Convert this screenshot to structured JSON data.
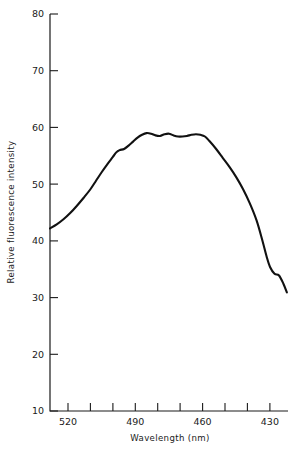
{
  "chart_data": {
    "type": "line",
    "title": "",
    "xlabel": "Wavelength (nm)",
    "ylabel": "Relative fluorescence intensity",
    "xlim": [
      528,
      422
    ],
    "ylim": [
      10,
      80
    ],
    "x_axis_reversed": true,
    "grid": false,
    "legend": null,
    "xticks_major": [
      520,
      490,
      460,
      430
    ],
    "xticklabels": [
      "520",
      "490",
      "460",
      "430"
    ],
    "xticks_minor": [
      520,
      510,
      500,
      490,
      480,
      470,
      460,
      450,
      440,
      430
    ],
    "yticks": [
      10,
      20,
      30,
      40,
      50,
      60,
      70,
      80
    ],
    "yticklabels": [
      "10",
      "20",
      "30",
      "40",
      "50",
      "60",
      "70",
      "80"
    ],
    "tick_direction": "in",
    "series": [
      {
        "name": "fluorescence emission",
        "color": "#111111",
        "x": [
          528.0,
          525.0,
          522.0,
          519.0,
          516.0,
          513.0,
          510.0,
          507.5,
          505.0,
          502.5,
          500.0,
          498.5,
          497.0,
          495.0,
          493.0,
          491.0,
          489.0,
          487.0,
          485.0,
          483.0,
          481.0,
          479.0,
          477.0,
          475.0,
          473.0,
          471.0,
          469.0,
          467.0,
          465.0,
          463.0,
          461.0,
          459.0,
          457.0,
          454.0,
          451.0,
          448.0,
          445.0,
          442.0,
          439.0,
          436.0,
          433.5,
          431.5,
          430.0,
          428.0,
          426.0,
          424.0,
          422.5
        ],
        "y": [
          42.2,
          42.9,
          43.8,
          44.9,
          46.2,
          47.6,
          49.1,
          50.6,
          52.1,
          53.5,
          54.8,
          55.6,
          56.0,
          56.2,
          56.8,
          57.5,
          58.2,
          58.7,
          59.0,
          58.9,
          58.6,
          58.5,
          58.8,
          58.9,
          58.6,
          58.4,
          58.4,
          58.5,
          58.7,
          58.8,
          58.7,
          58.4,
          57.6,
          56.2,
          54.6,
          53.0,
          51.2,
          49.1,
          46.6,
          43.6,
          40.2,
          37.2,
          35.4,
          34.2,
          33.9,
          32.4,
          30.9
        ],
        "endpoint_values": {
          "start": 42.2,
          "peak": 59.0,
          "end": 28.5
        }
      }
    ]
  },
  "axis": {
    "x_title": "Wavelength (nm)",
    "y_title": "Relative fluorescence intensity"
  }
}
